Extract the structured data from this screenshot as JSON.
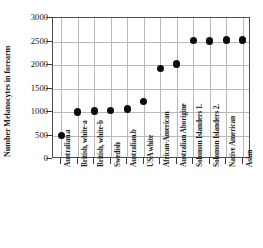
{
  "chart_data": {
    "type": "scatter",
    "title": "",
    "xlabel": "",
    "ylabel": "Number Melanocytes in forearm",
    "ylim": [
      0,
      3000
    ],
    "yticks": [
      0,
      500,
      1000,
      1500,
      2000,
      2500,
      3000
    ],
    "ytick_labels": [
      "0",
      "500",
      "1000",
      "1500",
      "2000",
      "2500",
      "3000"
    ],
    "grid": true,
    "legend": "none",
    "marker": "filled-circle",
    "marker_color": "#0b0b0b",
    "categories": [
      "Australian.a",
      "British, white-a",
      "British,  white-b",
      "Swedish",
      "Australian.b",
      "USA white",
      "African-American",
      "Australian Aborigine",
      "Solomon Islanders 1.",
      "Solomon Islanders 2.",
      "Native American",
      "Asian"
    ],
    "values": [
      500,
      1000,
      1020,
      1030,
      1060,
      1220,
      1920,
      2020,
      2520,
      2510,
      2530,
      2530
    ]
  },
  "axes": {
    "y_axis_title": "Number Melanocytes in forearm"
  }
}
